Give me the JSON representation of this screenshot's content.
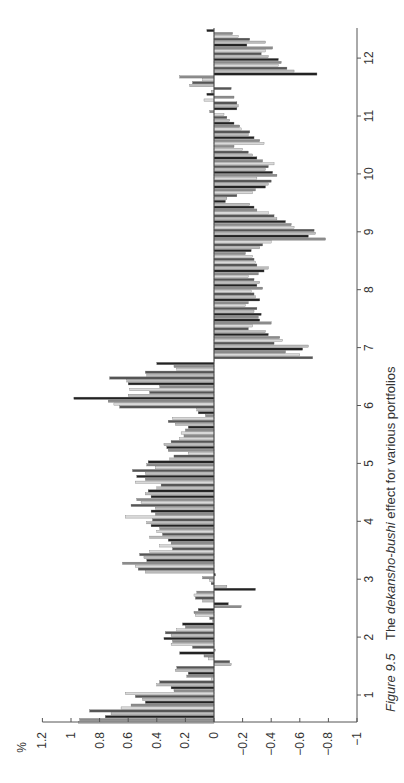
{
  "figure": {
    "caption_prefix": "Figure 9.5",
    "caption_text_before": "The ",
    "caption_emphasis": "dekansho-bushi",
    "caption_text_after": " effect for various portfolios"
  },
  "chart_data": {
    "type": "bar",
    "orientation": "rotated-90ccw",
    "title": "The dekansho-bushi effect for various portfolios",
    "xlabel": "Month",
    "ylabel": "%",
    "categories": [
      "1",
      "2",
      "3",
      "4",
      "5",
      "6",
      "7",
      "8",
      "9",
      "10",
      "11",
      "12"
    ],
    "y_ticks": [
      "1.2",
      "1",
      "0.8",
      "0.6",
      "0.4",
      "0.2",
      "0",
      "-0.2",
      "-0.4",
      "-0.6",
      "-0.8",
      "-1"
    ],
    "ylim": [
      -1,
      1.2
    ],
    "grid": false,
    "legend": "none",
    "bars_per_month": 20,
    "groups": [
      {
        "month": "1",
        "values": [
          0.95,
          0.94,
          0.76,
          0.72,
          0.87,
          0.65,
          0.58,
          0.48,
          0.5,
          0.55,
          0.62,
          0.28,
          0.3,
          0.4,
          0.38,
          0.02,
          0.19,
          0.18,
          0.27,
          0.26
        ]
      },
      {
        "month": "2",
        "values": [
          -0.12,
          -0.11,
          0.04,
          0.07,
          0.24,
          -0.01,
          0.15,
          0.3,
          0.29,
          0.35,
          0.3,
          0.34,
          0.26,
          0.2,
          0.22,
          0.01,
          0.03,
          0.13,
          0.14,
          0.11
        ]
      },
      {
        "month": "3",
        "values": [
          -0.19,
          -0.1,
          0.08,
          0.13,
          0.14,
          0.12,
          -0.29,
          -0.09,
          0.02,
          0.03,
          0.08,
          -0.01,
          0.48,
          0.53,
          0.55,
          0.64,
          0.47,
          0.49,
          0.52,
          0.45
        ]
      },
      {
        "month": "4",
        "values": [
          0.29,
          0.38,
          0.3,
          0.32,
          0.45,
          0.36,
          0.4,
          0.38,
          0.44,
          0.47,
          0.43,
          0.62,
          0.41,
          0.44,
          0.41,
          0.58,
          0.51,
          0.54,
          0.44,
          0.48
        ]
      },
      {
        "month": "5",
        "values": [
          0.46,
          0.4,
          0.37,
          0.55,
          0.48,
          0.54,
          0.48,
          0.57,
          0.41,
          0.47,
          0.46,
          0.31,
          0.28,
          0.18,
          0.32,
          0.33,
          0.35,
          0.3,
          0.24,
          0.21
        ]
      },
      {
        "month": "6",
        "values": [
          0.23,
          0.2,
          0.18,
          0.27,
          0.32,
          0.29,
          0.06,
          0.11,
          0.12,
          0.66,
          0.7,
          0.74,
          0.98,
          0.6,
          0.45,
          0.59,
          0.38,
          0.6,
          0.61,
          0.73
        ]
      },
      {
        "month": "7",
        "values": [
          0.47,
          0.48,
          0.26,
          0.28,
          0.4,
          0.0,
          -0.69,
          -0.6,
          -0.5,
          -0.62,
          -0.66,
          -0.42,
          -0.48,
          -0.46,
          -0.38,
          -0.36,
          -0.24,
          -0.27,
          -0.4,
          -0.32
        ]
      },
      {
        "month": "8",
        "values": [
          -0.31,
          -0.33,
          -0.28,
          -0.3,
          -0.22,
          -0.24,
          -0.32,
          -0.29,
          -0.28,
          -0.26,
          -0.34,
          -0.3,
          -0.32,
          -0.28,
          -0.24,
          -0.31,
          -0.35,
          -0.38,
          -0.3,
          -0.29
        ]
      },
      {
        "month": "9",
        "values": [
          -0.28,
          -0.27,
          -0.22,
          -0.26,
          -0.32,
          -0.34,
          -0.4,
          -0.78,
          -0.66,
          -0.71,
          -0.7,
          -0.56,
          -0.54,
          -0.5,
          -0.44,
          -0.42,
          -0.38,
          -0.3,
          -0.28,
          -0.25
        ]
      },
      {
        "month": "10",
        "values": [
          -0.08,
          -0.09,
          -0.16,
          -0.27,
          -0.29,
          -0.36,
          -0.38,
          -0.4,
          -0.3,
          -0.44,
          -0.41,
          -0.36,
          -0.38,
          -0.42,
          -0.34,
          -0.3,
          -0.27,
          -0.24,
          -0.2,
          -0.14
        ]
      },
      {
        "month": "11",
        "values": [
          -0.35,
          -0.32,
          -0.28,
          -0.24,
          -0.25,
          -0.19,
          -0.18,
          -0.14,
          -0.11,
          -0.09,
          -0.07,
          0.03,
          -0.16,
          -0.17,
          -0.16,
          0.07,
          -0.14,
          0.05,
          0.02,
          -0.12
        ]
      },
      {
        "month": "12",
        "values": [
          0.17,
          0.15,
          0.08,
          0.24,
          -0.72,
          -0.56,
          -0.51,
          -0.45,
          -0.47,
          -0.45,
          -0.38,
          -0.33,
          -0.36,
          -0.41,
          -0.23,
          -0.36,
          -0.25,
          -0.17,
          -0.13,
          0.05
        ]
      }
    ],
    "colors": {
      "bar_fills": [
        "#d9d9d9",
        "#bdbdbd",
        "#8c8c8c",
        "#555555",
        "#222222"
      ],
      "axis": "#555555",
      "text": "#333333"
    }
  },
  "layout": {
    "zero_x": 214,
    "px_per_unit": 143,
    "month_1_y": 695,
    "px_per_month": 57.9,
    "axis_bottom_y": 722,
    "axis_top_y": 28,
    "axis_right_x": 357
  }
}
